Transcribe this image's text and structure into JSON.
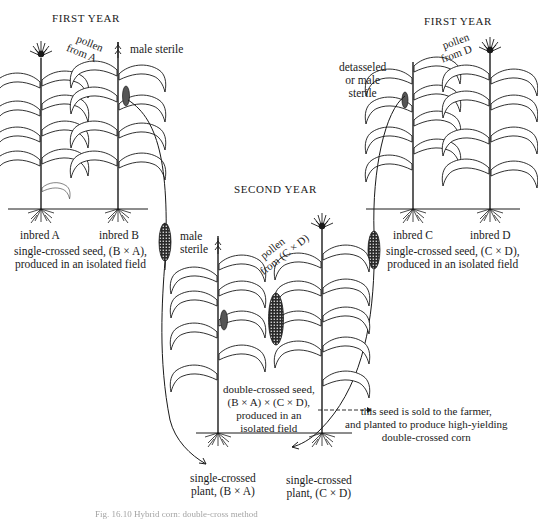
{
  "figure": {
    "sections": {
      "first_year_left": {
        "title": "FIRST YEAR",
        "pollen_label": [
          "pollen",
          "from A"
        ],
        "male_sterile_label": "male sterile",
        "plants": [
          "inbred A",
          "inbred B"
        ],
        "seed_caption": [
          "single-crossed seed, (B × A),",
          "produced in an isolated field"
        ]
      },
      "first_year_right": {
        "title": "FIRST YEAR",
        "pollen_label": [
          "pollen",
          "from D"
        ],
        "detasseled_label": [
          "detasseled",
          "or male",
          "sterile"
        ],
        "plants": [
          "inbred C",
          "inbred D"
        ],
        "seed_caption": [
          "single-crossed seed, (C × D),",
          "produced in an isolated field"
        ]
      },
      "second_year": {
        "title": "SECOND YEAR",
        "male_sterile_label": [
          "male",
          "sterile"
        ],
        "pollen_label": [
          "pollen",
          "from (C × D)"
        ],
        "double_cross_caption": [
          "double-crossed seed,",
          "(B × A) × (C × D),",
          "produced in an",
          "isolated field"
        ],
        "farmer_note": [
          "this seed is sold to the farmer,",
          "and planted to produce high-yielding",
          "double-crossed corn"
        ],
        "plants": [
          [
            "single-crossed",
            "plant, (B × A)"
          ],
          [
            "single-crossed",
            "plant, (C × D)"
          ]
        ]
      }
    },
    "caption": "Fig. 16.10  Hybrid corn: double-cross method"
  }
}
